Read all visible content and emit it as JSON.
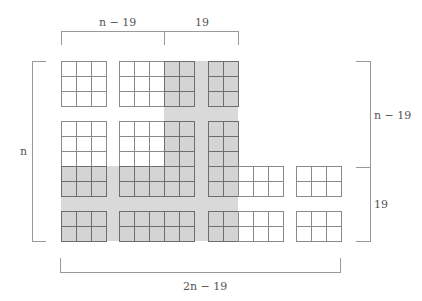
{
  "labels": {
    "top_left": "n − 19",
    "top_right": "19",
    "left": "n",
    "right_upper": "n − 19",
    "right_lower": "19",
    "bottom": "2n − 19"
  },
  "colors": {
    "shade": "#d9d9d9",
    "gray_cell": "#d4d4d4",
    "white_cell": "#ffffff",
    "grid_line": "#8a8a8a",
    "bracket": "#9a9a9a"
  },
  "grid": {
    "cell_size": 15,
    "columns": [
      {
        "x": 61,
        "n": 3
      },
      {
        "x": 119,
        "n": 5
      },
      {
        "x": 208,
        "n": 2
      },
      {
        "x": 238,
        "n": 3
      },
      {
        "x": 296,
        "n": 3
      }
    ],
    "row_blocks": [
      {
        "y": 61,
        "n": 3
      },
      {
        "y": 121,
        "n": 5
      },
      {
        "y": 211,
        "n": 2
      }
    ],
    "blocks": [
      {
        "x": 61,
        "y": 61,
        "cols": 3,
        "rows": 3,
        "gray_cols_from": 99,
        "gray_rows_from": 99
      },
      {
        "x": 119,
        "y": 61,
        "cols": 5,
        "rows": 3,
        "gray_cols_from": 3,
        "gray_rows_from": 99
      },
      {
        "x": 208,
        "y": 61,
        "cols": 2,
        "rows": 3,
        "gray_cols_from": 0,
        "gray_rows_from": 99
      },
      {
        "x": 61,
        "y": 121,
        "cols": 3,
        "rows": 5,
        "gray_cols_from": 99,
        "gray_rows_from": 3
      },
      {
        "x": 119,
        "y": 121,
        "cols": 5,
        "rows": 5,
        "gray_cols_from": 3,
        "gray_rows_from": 3
      },
      {
        "x": 208,
        "y": 121,
        "cols": 2,
        "rows": 5,
        "gray_cols_from": 0,
        "gray_rows_from": 3
      },
      {
        "x": 238,
        "y": 166,
        "cols": 3,
        "rows": 2,
        "gray_cols_from": 99,
        "gray_rows_from": 99
      },
      {
        "x": 296,
        "y": 166,
        "cols": 3,
        "rows": 2,
        "gray_cols_from": 99,
        "gray_rows_from": 99
      },
      {
        "x": 61,
        "y": 211,
        "cols": 3,
        "rows": 2,
        "gray_cols_from": 99,
        "gray_rows_from": 0
      },
      {
        "x": 119,
        "y": 211,
        "cols": 5,
        "rows": 2,
        "gray_cols_from": 99,
        "gray_rows_from": 0
      },
      {
        "x": 208,
        "y": 211,
        "cols": 2,
        "rows": 2,
        "gray_cols_from": 0,
        "gray_rows_from": 0
      },
      {
        "x": 238,
        "y": 211,
        "cols": 3,
        "rows": 2,
        "gray_cols_from": 99,
        "gray_rows_from": 99
      },
      {
        "x": 296,
        "y": 211,
        "cols": 3,
        "rows": 2,
        "gray_cols_from": 99,
        "gray_rows_from": 99
      }
    ]
  }
}
